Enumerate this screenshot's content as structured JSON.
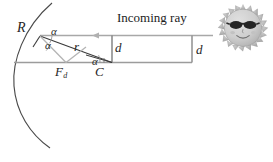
{
  "figure": {
    "title_text": "Incoming ray",
    "labels": {
      "radius_vertex": "R",
      "ray_distance": "r",
      "focus_point": "F",
      "focus_subscript": "d",
      "center_point": "C",
      "offset_left": "d",
      "offset_right": "d",
      "angle_1": "α",
      "angle_2": "α",
      "angle_3": "α"
    },
    "icons": {
      "sun": "sun-with-sunglasses-icon",
      "ray_arrow": "left-arrowhead-icon"
    },
    "colors": {
      "line_dark": "#3a3a3a",
      "line_gray": "#a8a8a8",
      "arc": "#4a4a4a",
      "axis": "#9a9a9a",
      "sun_body": "#b9b9b9",
      "sun_face": "#d2d2d2",
      "sun_glasses": "#2a2a2a",
      "text": "#262626"
    }
  }
}
